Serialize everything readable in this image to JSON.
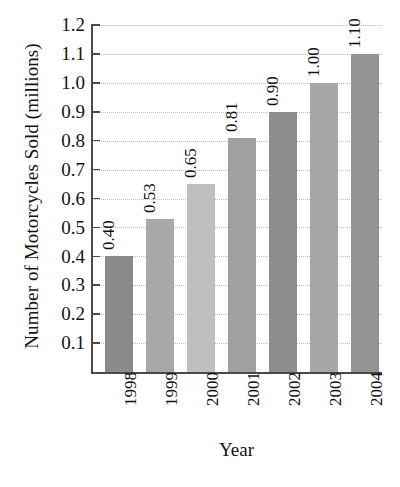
{
  "chart_data": {
    "type": "bar",
    "title": "",
    "xlabel": "Year",
    "ylabel": "Number of Motorcycles Sold (millions)",
    "categories": [
      "1998",
      "1999",
      "2000",
      "2001",
      "2002",
      "2003",
      "2004"
    ],
    "values": [
      0.4,
      0.53,
      0.65,
      0.81,
      0.9,
      1.0,
      1.1
    ],
    "value_labels": [
      "0.40",
      "0.53",
      "0.65",
      "0.81",
      "0.90",
      "1.00",
      "1.10"
    ],
    "bar_colors": [
      "#8a8a8a",
      "#a8a8a8",
      "#bfbfbf",
      "#a0a0a0",
      "#8d8d8d",
      "#a6a6a6",
      "#949494"
    ],
    "ylim": [
      0,
      1.2
    ],
    "ytick_values": [
      0.1,
      0.2,
      0.3,
      0.4,
      0.5,
      0.6,
      0.7,
      0.8,
      0.9,
      1.0,
      1.1,
      1.2
    ],
    "ytick_labels": [
      "0.1",
      "0.2",
      "0.3",
      "0.4",
      "0.5",
      "0.6",
      "0.7",
      "0.8",
      "0.9",
      "1.0",
      "1.1",
      "1.2"
    ],
    "grid": true,
    "grid_style": "dotted",
    "grid_color": "#bdbdbd",
    "legend": false,
    "orientation": "vertical",
    "value_label_rotation": 90,
    "category_label_rotation": 90,
    "background_color": "#ffffff",
    "axis_color": "#4a4a4a"
  }
}
